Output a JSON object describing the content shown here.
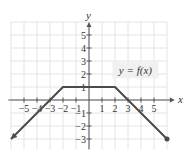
{
  "chart_data": {
    "type": "line",
    "title": "",
    "xlabel": "x",
    "ylabel": "y",
    "xlim": [
      -6,
      6
    ],
    "ylim": [
      -3.8,
      6
    ],
    "x_ticks": [
      -5,
      -4,
      -3,
      -2,
      -1,
      1,
      2,
      3,
      4,
      5
    ],
    "y_ticks": [
      -3,
      -2,
      -1,
      1,
      2,
      3,
      4,
      5
    ],
    "grid": true,
    "annotation": "y = f(x)",
    "series": [
      {
        "name": "f(x)",
        "points": [
          [
            -6,
            -3
          ],
          [
            -2,
            1
          ],
          [
            2,
            1
          ],
          [
            6,
            -3
          ]
        ],
        "left_end": "arrow",
        "right_end": "closed-dot"
      }
    ]
  },
  "labels": {
    "x_axis": "x",
    "y_axis": "y",
    "function": "y = f(x)"
  },
  "colors": {
    "grid": "#e4e4e4",
    "axis": "#555555",
    "curve": "#4a4a4a",
    "label_box": "#f0f0f0"
  }
}
